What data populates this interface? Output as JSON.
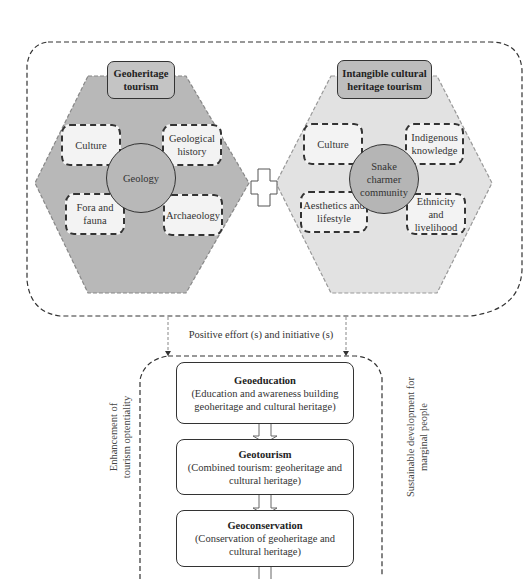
{
  "colors": {
    "geoheritage_hexagon": "#b8b8b8",
    "intangible_hexagon": "#e2e2e2",
    "geoheritage_title_fill": "#c4c4c4",
    "intangible_title_fill": "#bdbdbd",
    "geology_circle_fill": "#b8b8b8",
    "snake_circle_fill": "#b5b5b5",
    "sub_box_fill": "#f3f3f3",
    "outline": "#333333"
  },
  "geoheritage": {
    "title_line1": "Geoheritage",
    "title_line2": "tourism",
    "center": "Geology",
    "items": [
      {
        "line1": "Culture",
        "line2": ""
      },
      {
        "line1": "Geological",
        "line2": "history"
      },
      {
        "line1": "Fora and",
        "line2": "fauna"
      },
      {
        "line1": "Archaeology",
        "line2": ""
      }
    ]
  },
  "intangible": {
    "title_line1": "Intangible cultural",
    "title_line2": "heritage tourism",
    "center_line1": "Snake",
    "center_line2": "charmer",
    "center_line3": "community",
    "items": [
      {
        "line1": "Culture",
        "line2": ""
      },
      {
        "line1": "Indigenous",
        "line2": "knowledge"
      },
      {
        "line1": "Aesthetics and",
        "line2": "lifestyle"
      },
      {
        "line1": "Ethnicity and",
        "line2": "livelihood"
      }
    ]
  },
  "connector_label": "Positive effort (s) and initiative (s)",
  "side_labels": {
    "left_line1": "Enhancement of",
    "left_line2": "tourism optentiality",
    "right_line1": "Sustainable development for",
    "right_line2": "marginal people"
  },
  "steps": [
    {
      "title": "Geoeducation",
      "line1": "(Education and awareness building",
      "line2": "geoheritage and cultural heritage)"
    },
    {
      "title": "Geotourism",
      "line1": "(Combined tourism: geoheritage and",
      "line2": "cultural heritage)"
    },
    {
      "title": "Geoconservation",
      "line1": "(Conservation of geoheritage and",
      "line2": "cultural heritage)"
    }
  ]
}
